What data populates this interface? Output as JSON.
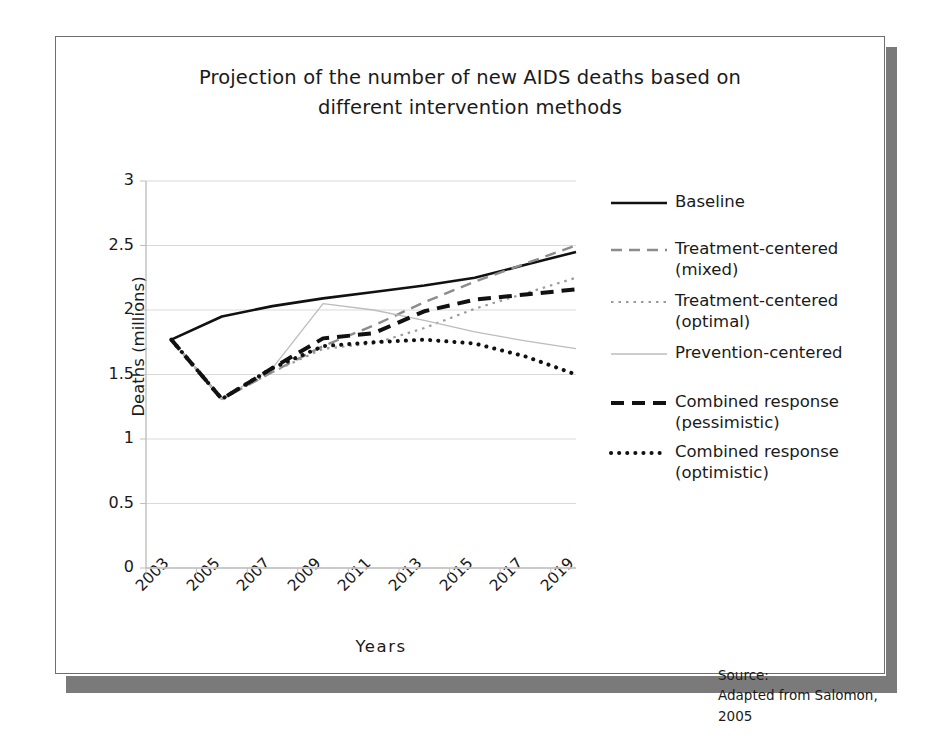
{
  "figure": {
    "title_line1": "Projection of the number of new AIDS deaths based on",
    "title_line2": "different intervention methods",
    "source_label": "Source:",
    "source_text": "Adapted from Salomon, 2005"
  },
  "chart_data": {
    "type": "line",
    "title": "Projection of the number of new AIDS deaths based on different intervention methods",
    "xlabel": "Years",
    "ylabel": "Deaths (millions)",
    "xlim": [
      2003,
      2020
    ],
    "ylim": [
      0,
      3
    ],
    "ytick_labels": [
      "0",
      "0.5",
      "1",
      "1.5",
      "2",
      "2.5",
      "3"
    ],
    "ytick_values": [
      0,
      0.5,
      1,
      1.5,
      2,
      2.5,
      3
    ],
    "xtick_labels": [
      "2003",
      "2005",
      "2007",
      "2009",
      "2011",
      "2013",
      "2015",
      "2017",
      "2019"
    ],
    "xtick_values": [
      2003,
      2005,
      2007,
      2009,
      2011,
      2013,
      2015,
      2017,
      2019
    ],
    "grid": "horizontal",
    "legend_position": "right",
    "x": [
      2004,
      2006,
      2008,
      2010,
      2012,
      2014,
      2016,
      2018,
      2020
    ],
    "series": [
      {
        "name": "Baseline",
        "style": "solid",
        "color": "#111111",
        "width": 2.6,
        "values": [
          1.77,
          1.95,
          2.03,
          2.09,
          2.14,
          2.19,
          2.25,
          2.35,
          2.45
        ]
      },
      {
        "name": "Treatment-centered (mixed)",
        "label_line1": "Treatment-centered",
        "label_line2": "(mixed)",
        "style": "dashed",
        "color": "#8c8c8c",
        "width": 2.4,
        "values": [
          1.77,
          1.31,
          1.52,
          1.72,
          1.88,
          2.06,
          2.22,
          2.36,
          2.5
        ]
      },
      {
        "name": "Treatment-centered (optimal)",
        "label_line1": "Treatment-centered",
        "label_line2": "(optimal)",
        "style": "dotted",
        "color": "#9a9a9a",
        "width": 2.2,
        "values": [
          1.77,
          1.31,
          1.52,
          1.7,
          1.74,
          1.86,
          2.01,
          2.13,
          2.25
        ]
      },
      {
        "name": "Prevention-centered",
        "style": "solid-thin",
        "color": "#bcbcbc",
        "width": 1.3,
        "values": [
          1.77,
          1.31,
          1.55,
          2.05,
          2.0,
          1.92,
          1.83,
          1.76,
          1.7
        ]
      },
      {
        "name": "Combined response (pessimistic)",
        "label_line1": "Combined response",
        "label_line2": "(pessimistic)",
        "style": "dashed-heavy",
        "color": "#111111",
        "width": 4.0,
        "values": [
          1.77,
          1.31,
          1.55,
          1.78,
          1.82,
          1.99,
          2.08,
          2.12,
          2.16
        ]
      },
      {
        "name": "Combined response (optimistic)",
        "label_line1": "Combined response",
        "label_line2": "(optimistic)",
        "style": "dotted-heavy",
        "color": "#111111",
        "width": 4.0,
        "values": [
          1.77,
          1.31,
          1.55,
          1.72,
          1.75,
          1.77,
          1.74,
          1.64,
          1.5
        ]
      }
    ]
  },
  "colors": {
    "frame": "#6e6e6e",
    "shadow": "#7a7a7a",
    "grid": "#d9d9d9",
    "axis": "#bfbfbf",
    "text": "#1a1a1a"
  }
}
